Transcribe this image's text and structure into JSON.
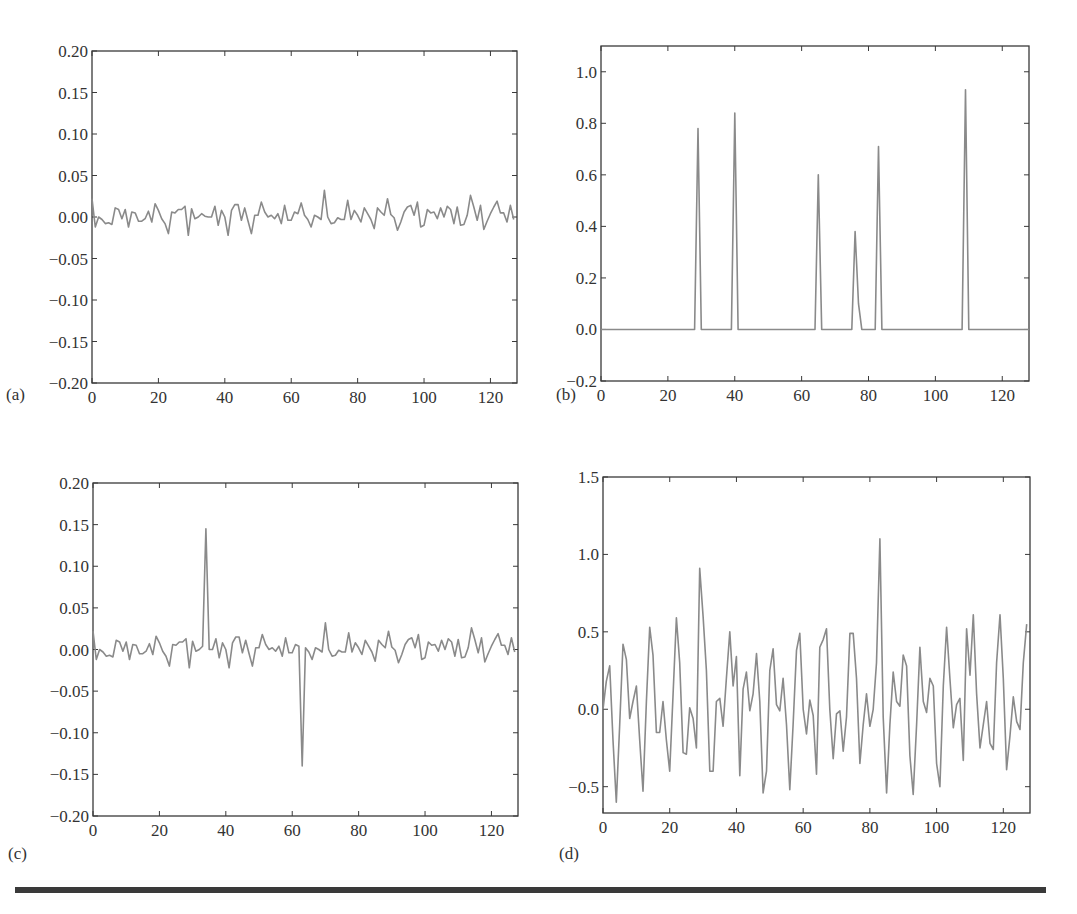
{
  "chart_data": [
    {
      "id": "a",
      "panel_label": "(a)",
      "type": "line",
      "title": "",
      "xlabel": "",
      "ylabel": "",
      "xlim": [
        0,
        128
      ],
      "ylim": [
        -0.2,
        0.2
      ],
      "xticks": [
        0,
        20,
        40,
        60,
        80,
        100,
        120
      ],
      "yticks": [
        -0.2,
        -0.15,
        -0.1,
        -0.05,
        0.0,
        0.05,
        0.1,
        0.15,
        0.2
      ],
      "ytick_labels": [
        "−0.20",
        "−0.15",
        "−0.10",
        "−0.05",
        "0.00",
        "0.05",
        "0.10",
        "0.15",
        "0.20"
      ],
      "grid": false,
      "legend": null,
      "description": "Low-amplitude noise around zero (±0.03)",
      "x": [
        0,
        1,
        2,
        3,
        4,
        5,
        6,
        7,
        8,
        9,
        10,
        11,
        12,
        13,
        14,
        15,
        16,
        17,
        18,
        19,
        20,
        21,
        22,
        23,
        24,
        25,
        26,
        27,
        28,
        29,
        30,
        31,
        32,
        33,
        34,
        35,
        36,
        37,
        38,
        39,
        40,
        41,
        42,
        43,
        44,
        45,
        46,
        47,
        48,
        49,
        50,
        51,
        52,
        53,
        54,
        55,
        56,
        57,
        58,
        59,
        60,
        61,
        62,
        63,
        64,
        65,
        66,
        67,
        68,
        69,
        70,
        71,
        72,
        73,
        74,
        75,
        76,
        77,
        78,
        79,
        80,
        81,
        82,
        83,
        84,
        85,
        86,
        87,
        88,
        89,
        90,
        91,
        92,
        93,
        94,
        95,
        96,
        97,
        98,
        99,
        100,
        101,
        102,
        103,
        104,
        105,
        106,
        107,
        108,
        109,
        110,
        111,
        112,
        113,
        114,
        115,
        116,
        117,
        118,
        119,
        120,
        121,
        122,
        123,
        124,
        125,
        126,
        127
      ],
      "values": [
        0.022,
        -0.012,
        0.0,
        -0.003,
        -0.008,
        -0.007,
        -0.009,
        0.011,
        0.009,
        -0.002,
        0.009,
        -0.012,
        0.006,
        0.005,
        -0.005,
        -0.005,
        -0.002,
        0.007,
        -0.006,
        0.016,
        0.008,
        -0.002,
        -0.008,
        -0.02,
        0.006,
        0.005,
        0.009,
        0.009,
        0.013,
        -0.022,
        0.01,
        -0.002,
        0.0,
        0.004,
        0.001,
        0.0,
        0.0,
        0.013,
        -0.01,
        0.008,
        0.0,
        -0.022,
        0.008,
        0.015,
        0.015,
        -0.004,
        0.011,
        -0.005,
        -0.02,
        0.002,
        0.002,
        0.018,
        0.006,
        0.0,
        0.002,
        -0.002,
        0.004,
        -0.008,
        0.014,
        -0.004,
        -0.004,
        0.006,
        0.004,
        0.017,
        0.002,
        -0.003,
        -0.012,
        0.002,
        0.0,
        -0.003,
        0.032,
        0.0,
        -0.008,
        -0.007,
        -0.001,
        -0.003,
        -0.003,
        0.02,
        -0.003,
        0.008,
        0.002,
        -0.006,
        0.011,
        0.004,
        -0.003,
        -0.014,
        0.011,
        0.006,
        0.002,
        0.022,
        0.003,
        -0.001,
        -0.016,
        -0.006,
        0.006,
        0.012,
        0.014,
        0.002,
        0.018,
        -0.012,
        -0.01,
        0.009,
        0.005,
        0.006,
        -0.002,
        0.011,
        0.0,
        0.013,
        0.009,
        -0.008,
        0.012,
        -0.01,
        -0.009,
        0.002,
        0.026,
        0.012,
        -0.004,
        0.014,
        -0.015,
        -0.005,
        0.004,
        0.012,
        0.019,
        0.005,
        0.005,
        -0.006,
        0.014,
        -0.003
      ]
    },
    {
      "id": "b",
      "panel_label": "(b)",
      "type": "line",
      "title": "",
      "xlabel": "",
      "ylabel": "",
      "xlim": [
        0,
        128
      ],
      "ylim": [
        -0.2,
        1.1
      ],
      "xticks": [
        0,
        20,
        40,
        60,
        80,
        100,
        120
      ],
      "yticks": [
        -0.2,
        0.0,
        0.2,
        0.4,
        0.6,
        0.8,
        1.0
      ],
      "ytick_labels": [
        "−0.2",
        "0.0",
        "0.2",
        "0.4",
        "0.6",
        "0.8",
        "1.0"
      ],
      "grid": false,
      "legend": null,
      "description": "Sparse spike train: six isolated peaks on a zero baseline",
      "peaks": [
        {
          "x": 29,
          "y": 0.78
        },
        {
          "x": 40,
          "y": 0.84
        },
        {
          "x": 65,
          "y": 0.6
        },
        {
          "x": 76,
          "y": 0.38
        },
        {
          "x": 83,
          "y": 0.71
        },
        {
          "x": 109,
          "y": 0.93
        }
      ],
      "x": [
        0,
        28,
        29,
        30,
        39,
        40,
        41,
        64,
        65,
        66,
        75,
        76,
        77,
        78,
        82,
        83,
        84,
        108,
        109,
        110,
        128
      ],
      "values": [
        0,
        0,
        0.78,
        0,
        0,
        0.84,
        0,
        0,
        0.6,
        0,
        0,
        0.38,
        0.1,
        0,
        0,
        0.71,
        0,
        0,
        0.93,
        0,
        0
      ]
    },
    {
      "id": "c",
      "panel_label": "(c)",
      "type": "line",
      "title": "",
      "xlabel": "",
      "ylabel": "",
      "xlim": [
        0,
        128
      ],
      "ylim": [
        -0.2,
        0.2
      ],
      "xticks": [
        0,
        20,
        40,
        60,
        80,
        100,
        120
      ],
      "yticks": [
        -0.2,
        -0.15,
        -0.1,
        -0.05,
        0.0,
        0.05,
        0.1,
        0.15,
        0.2
      ],
      "ytick_labels": [
        "−0.20",
        "−0.15",
        "−0.10",
        "−0.05",
        "0.00",
        "0.05",
        "0.10",
        "0.15",
        "0.20"
      ],
      "grid": false,
      "legend": null,
      "description": "Same noise as (a) with a positive spike (~0.145) at x≈34 and a negative spike (~−0.14) at x≈63",
      "spikes": [
        {
          "x": 34,
          "y": 0.145
        },
        {
          "x": 63,
          "y": -0.14
        }
      ],
      "x": [
        0,
        1,
        2,
        3,
        4,
        5,
        6,
        7,
        8,
        9,
        10,
        11,
        12,
        13,
        14,
        15,
        16,
        17,
        18,
        19,
        20,
        21,
        22,
        23,
        24,
        25,
        26,
        27,
        28,
        29,
        30,
        31,
        32,
        33,
        34,
        35,
        36,
        37,
        38,
        39,
        40,
        41,
        42,
        43,
        44,
        45,
        46,
        47,
        48,
        49,
        50,
        51,
        52,
        53,
        54,
        55,
        56,
        57,
        58,
        59,
        60,
        61,
        62,
        63,
        64,
        65,
        66,
        67,
        68,
        69,
        70,
        71,
        72,
        73,
        74,
        75,
        76,
        77,
        78,
        79,
        80,
        81,
        82,
        83,
        84,
        85,
        86,
        87,
        88,
        89,
        90,
        91,
        92,
        93,
        94,
        95,
        96,
        97,
        98,
        99,
        100,
        101,
        102,
        103,
        104,
        105,
        106,
        107,
        108,
        109,
        110,
        111,
        112,
        113,
        114,
        115,
        116,
        117,
        118,
        119,
        120,
        121,
        122,
        123,
        124,
        125,
        126,
        127
      ],
      "values": [
        0.022,
        -0.012,
        0.0,
        -0.003,
        -0.008,
        -0.007,
        -0.009,
        0.011,
        0.009,
        -0.002,
        0.009,
        -0.012,
        0.006,
        0.005,
        -0.005,
        -0.005,
        -0.002,
        0.007,
        -0.006,
        0.016,
        0.008,
        -0.002,
        -0.008,
        -0.02,
        0.006,
        0.005,
        0.009,
        0.009,
        0.013,
        -0.022,
        0.01,
        -0.002,
        0.0,
        0.004,
        0.145,
        0.0,
        0.0,
        0.013,
        -0.01,
        0.008,
        0.0,
        -0.022,
        0.008,
        0.015,
        0.015,
        -0.004,
        0.011,
        -0.005,
        -0.02,
        0.002,
        0.002,
        0.018,
        0.006,
        0.0,
        0.002,
        -0.002,
        0.004,
        -0.008,
        0.014,
        -0.004,
        -0.004,
        0.006,
        0.004,
        -0.14,
        0.002,
        -0.003,
        -0.012,
        0.002,
        0.0,
        -0.003,
        0.032,
        0.0,
        -0.008,
        -0.007,
        -0.001,
        -0.003,
        -0.003,
        0.02,
        -0.003,
        0.008,
        0.002,
        -0.006,
        0.011,
        0.004,
        -0.003,
        -0.014,
        0.011,
        0.006,
        0.002,
        0.022,
        0.003,
        -0.001,
        -0.016,
        -0.006,
        0.006,
        0.012,
        0.014,
        0.002,
        0.018,
        -0.012,
        -0.01,
        0.009,
        0.005,
        0.006,
        -0.002,
        0.011,
        0.0,
        0.013,
        0.009,
        -0.008,
        0.012,
        -0.01,
        -0.009,
        0.002,
        0.026,
        0.012,
        -0.004,
        0.014,
        -0.015,
        -0.005,
        0.004,
        0.012,
        0.019,
        0.005,
        0.005,
        -0.006,
        0.014,
        -0.003
      ]
    },
    {
      "id": "d",
      "panel_label": "(d)",
      "type": "line",
      "title": "",
      "xlabel": "",
      "ylabel": "",
      "xlim": [
        0,
        128
      ],
      "ylim": [
        -0.67,
        1.5
      ],
      "xticks": [
        0,
        20,
        40,
        60,
        80,
        100,
        120
      ],
      "yticks": [
        -0.5,
        0.0,
        0.5,
        1.0,
        1.5
      ],
      "ytick_labels": [
        "−0.5",
        "0.0",
        "0.5",
        "1.0",
        "1.5"
      ],
      "grid": false,
      "legend": null,
      "description": "Dense oscillating signal ranging roughly −0.6 to 1.1",
      "x": [
        0,
        1,
        2,
        3,
        4,
        5,
        6,
        7,
        8,
        9,
        10,
        11,
        12,
        13,
        14,
        15,
        16,
        17,
        18,
        19,
        20,
        21,
        22,
        23,
        24,
        25,
        26,
        27,
        28,
        29,
        30,
        31,
        32,
        33,
        34,
        35,
        36,
        37,
        38,
        39,
        40,
        41,
        42,
        43,
        44,
        45,
        46,
        47,
        48,
        49,
        50,
        51,
        52,
        53,
        54,
        55,
        56,
        57,
        58,
        59,
        60,
        61,
        62,
        63,
        64,
        65,
        66,
        67,
        68,
        69,
        70,
        71,
        72,
        73,
        74,
        75,
        76,
        77,
        78,
        79,
        80,
        81,
        82,
        83,
        84,
        85,
        86,
        87,
        88,
        89,
        90,
        91,
        92,
        93,
        94,
        95,
        96,
        97,
        98,
        99,
        100,
        101,
        102,
        103,
        104,
        105,
        106,
        107,
        108,
        109,
        110,
        111,
        112,
        113,
        114,
        115,
        116,
        117,
        118,
        119,
        120,
        121,
        122,
        123,
        124,
        125,
        126,
        127
      ],
      "values": [
        0.0,
        0.18,
        0.28,
        -0.2,
        -0.6,
        -0.1,
        0.42,
        0.32,
        -0.06,
        0.05,
        0.15,
        -0.2,
        -0.53,
        0.05,
        0.53,
        0.35,
        -0.15,
        -0.15,
        0.05,
        -0.2,
        -0.4,
        0.1,
        0.59,
        0.3,
        -0.28,
        -0.29,
        0.01,
        -0.06,
        -0.25,
        0.91,
        0.6,
        0.25,
        -0.4,
        -0.4,
        0.05,
        0.07,
        -0.11,
        0.2,
        0.5,
        0.15,
        0.34,
        -0.43,
        0.13,
        0.24,
        -0.01,
        0.1,
        0.36,
        0.05,
        -0.54,
        -0.4,
        0.25,
        0.39,
        0.03,
        -0.01,
        0.2,
        -0.1,
        -0.52,
        -0.1,
        0.38,
        0.49,
        0.0,
        -0.16,
        0.06,
        -0.04,
        -0.42,
        0.4,
        0.45,
        0.52,
        0.0,
        -0.32,
        -0.03,
        -0.01,
        -0.27,
        -0.05,
        0.49,
        0.49,
        0.2,
        -0.35,
        -0.1,
        0.1,
        -0.11,
        0.0,
        0.3,
        1.1,
        -0.05,
        -0.54,
        -0.1,
        0.24,
        0.05,
        0.02,
        0.35,
        0.28,
        -0.3,
        -0.55,
        -0.1,
        0.4,
        0.05,
        -0.02,
        0.2,
        0.15,
        -0.35,
        -0.5,
        0.15,
        0.53,
        0.2,
        -0.12,
        0.03,
        0.07,
        -0.33,
        0.52,
        0.22,
        0.61,
        0.1,
        -0.25,
        -0.1,
        0.05,
        -0.22,
        -0.26,
        0.3,
        0.61,
        0.2,
        -0.39,
        -0.17,
        0.08,
        -0.08,
        -0.13,
        0.3,
        0.55
      ]
    }
  ],
  "figure": {
    "line_color": "#8a8a8a",
    "axis_color": "#3a3a3a",
    "separator_color": "#3a3a3a",
    "caption_visible_text": ""
  }
}
